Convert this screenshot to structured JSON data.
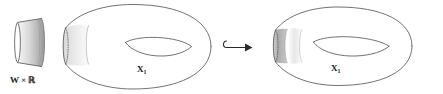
{
  "figure": {
    "kind": "mathematical-diagram",
    "background_color": "#ffffff",
    "outline_color": "#58585a",
    "labels": {
      "collar": "W × ℝ",
      "collar_w": "W",
      "collar_times": "×",
      "collar_r": "ℝ",
      "surface_left": "X",
      "surface_left_sub": "1",
      "surface_right": "X",
      "surface_right_sub": "1"
    },
    "arrow": {
      "name": "hook-arrow",
      "glyph": "↪",
      "meaning": "embedding",
      "color": "#2b2b2b"
    },
    "shading": {
      "collar_light": "#e2e2e2",
      "collar_dark": "#a8a8a8",
      "band_light": "#ececec",
      "band_dark": "#b4b4b4",
      "white": "#ffffff"
    },
    "panels": [
      {
        "name": "collar-cylinder",
        "label": "W × ℝ",
        "has_dark_band": true
      },
      {
        "name": "surface-before",
        "label": "X1",
        "has_dark_band": false,
        "band_count": 1
      },
      {
        "name": "surface-after",
        "label": "X1",
        "has_dark_band": true,
        "band_count": 2
      }
    ]
  }
}
